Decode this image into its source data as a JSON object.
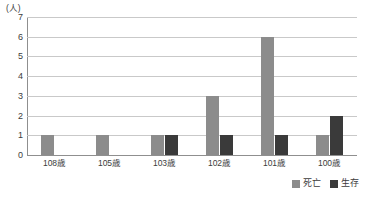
{
  "chart_data": {
    "type": "bar",
    "title": "",
    "xlabel": "",
    "ylabel": "(人)",
    "ylim": [
      0,
      7
    ],
    "yticks": [
      "7",
      "6",
      "5",
      "4",
      "3",
      "2",
      "1",
      "0"
    ],
    "grid": true,
    "legend_position": "bottom-right",
    "categories": [
      "108歳",
      "105歳",
      "103歳",
      "102歳",
      "101歳",
      "100歳"
    ],
    "series": [
      {
        "name": "死亡",
        "color": "#8c8c8c",
        "values": [
          1,
          1,
          1,
          3,
          6,
          1
        ]
      },
      {
        "name": "生存",
        "color": "#3a3a3a",
        "values": [
          0,
          0,
          1,
          1,
          1,
          2
        ]
      }
    ]
  },
  "axis": {
    "unit_label": "(人)"
  },
  "colors": {
    "gridline": "#c9c9c9",
    "axis": "#8f8f8f",
    "text": "#3c3c3c",
    "background": "#ffffff"
  }
}
